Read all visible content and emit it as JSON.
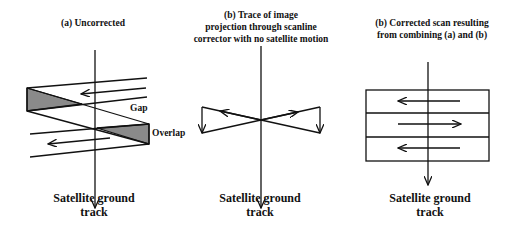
{
  "panels": [
    {
      "id": "a",
      "title_lines": [
        "(a) Uncorrected"
      ],
      "labels": {
        "gap": "Gap",
        "overlap": "Overlap"
      },
      "caption_lines": [
        "Satellite ground",
        "track"
      ]
    },
    {
      "id": "b",
      "title_lines": [
        "(b) Trace of image",
        "projection through scanline",
        "corrector with no satellite motion"
      ],
      "caption_lines": [
        "Satellite ground",
        "track"
      ]
    },
    {
      "id": "c",
      "title_lines": [
        "(b) Corrected scan resulting",
        "from combining (a) and (b)"
      ],
      "caption_lines": [
        "Satellite ground",
        "track"
      ]
    }
  ],
  "colors": {
    "line": "#111111",
    "shade": "#8a8a8a",
    "background": "#ffffff"
  }
}
